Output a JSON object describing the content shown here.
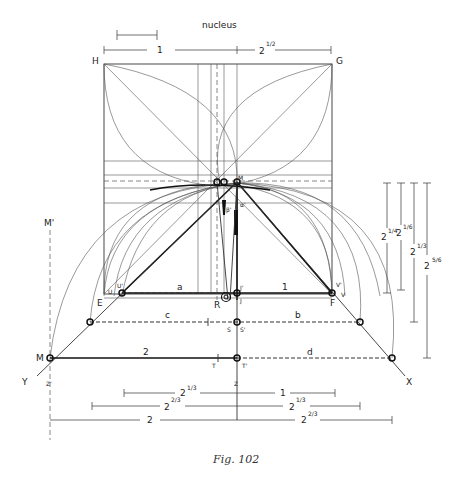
{
  "figure": {
    "caption": "Fig. 102",
    "top_dimension": {
      "nucleus_label": "nucleus",
      "left_label": "1",
      "right_base": "2",
      "right_exp": "1/2"
    },
    "corners": {
      "H": "H",
      "G": "G"
    },
    "points": {
      "M_top": "M",
      "M_prime": "M'",
      "beta_prime": "β'",
      "alpha_prime": "α'",
      "E": "E",
      "U": "U",
      "U_prime": "U'",
      "R": "R",
      "J_prime": "J'",
      "J": "J",
      "F": "F",
      "V_prime": "V'",
      "V": "V",
      "S": "S",
      "S_prime": "S'",
      "M_left": "M",
      "T": "T",
      "T_prime": "T'",
      "Y": "Y",
      "X": "X",
      "Z_prime": "Z'",
      "Z": "Z"
    },
    "segment_labels": {
      "a": "a",
      "one": "1",
      "c": "c",
      "b": "b",
      "two": "2",
      "d": "d"
    },
    "right_dimensions": [
      {
        "base": "2",
        "exp": "1/4"
      },
      {
        "base": "2",
        "exp": "1/6"
      },
      {
        "base": "2",
        "exp": "1/3"
      },
      {
        "base": "2",
        "exp": "5/6"
      }
    ],
    "bottom_dimensions": [
      {
        "left_base": "2",
        "left_exp": "1/3",
        "right_base": "1",
        "right_exp": ""
      },
      {
        "left_base": "2",
        "left_exp": "2/3",
        "right_base": "2",
        "right_exp": "1/3"
      },
      {
        "left_base": "2",
        "left_exp": "",
        "right_base": "2",
        "right_exp": "2/3"
      }
    ]
  }
}
